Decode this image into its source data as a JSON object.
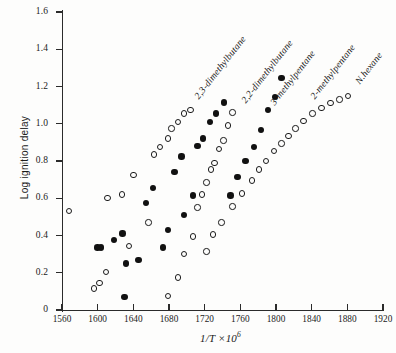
{
  "chart_data": {
    "type": "scatter",
    "title": "",
    "xlabel": "1/T ×10⁶",
    "ylabel": "Log ignition delay",
    "xlim": [
      1560,
      1920
    ],
    "ylim": [
      0.0,
      1.6
    ],
    "xticks": [
      1560,
      1600,
      1640,
      1680,
      1720,
      1760,
      1800,
      1840,
      1880,
      1920
    ],
    "yticks": [
      "0",
      "0.2",
      "0.4",
      "0.6",
      "0.8",
      "1.0",
      "1.2",
      "1.4",
      "1.6"
    ],
    "grid": false,
    "legend_position": "inline-annotations",
    "marker_styles": {
      "open": "open circle",
      "filled": "filled circle"
    },
    "series": [
      {
        "name": "2,3-dimethylbutane",
        "marker": "open",
        "label_angle_deg": -52,
        "label_x": 196,
        "label_y": 92,
        "points": [
          {
            "x": 1568,
            "y": 0.53
          },
          {
            "x": 1596,
            "y": 0.115
          },
          {
            "x": 1602,
            "y": 0.145
          },
          {
            "x": 1609,
            "y": 0.205
          },
          {
            "x": 1611,
            "y": 0.6
          },
          {
            "x": 1627,
            "y": 0.62
          },
          {
            "x": 1635,
            "y": 0.345
          },
          {
            "x": 1640,
            "y": 0.725
          },
          {
            "x": 1657,
            "y": 0.47
          },
          {
            "x": 1663,
            "y": 0.835
          },
          {
            "x": 1670,
            "y": 0.875
          },
          {
            "x": 1679,
            "y": 0.92
          },
          {
            "x": 1683,
            "y": 0.975
          },
          {
            "x": 1690,
            "y": 1.01
          },
          {
            "x": 1697,
            "y": 1.055
          },
          {
            "x": 1704,
            "y": 1.075
          }
        ]
      },
      {
        "name": "2,2-dimethylbutane",
        "marker": "filled",
        "label_angle_deg": -52,
        "label_x": 243,
        "label_y": 96,
        "points": [
          {
            "x": 1600,
            "y": 0.335
          },
          {
            "x": 1604,
            "y": 0.335
          },
          {
            "x": 1618,
            "y": 0.375
          },
          {
            "x": 1628,
            "y": 0.41
          },
          {
            "x": 1632,
            "y": 0.25
          },
          {
            "x": 1646,
            "y": 0.27
          },
          {
            "x": 1630,
            "y": 0.07
          },
          {
            "x": 1654,
            "y": 0.575
          },
          {
            "x": 1662,
            "y": 0.655
          },
          {
            "x": 1673,
            "y": 0.335
          },
          {
            "x": 1679,
            "y": 0.43
          },
          {
            "x": 1686,
            "y": 0.74
          },
          {
            "x": 1694,
            "y": 0.825
          },
          {
            "x": 1697,
            "y": 0.51
          },
          {
            "x": 1707,
            "y": 0.615
          },
          {
            "x": 1712,
            "y": 0.88
          },
          {
            "x": 1718,
            "y": 0.92
          },
          {
            "x": 1726,
            "y": 1.01
          },
          {
            "x": 1733,
            "y": 1.055
          },
          {
            "x": 1742,
            "y": 1.115
          }
        ]
      },
      {
        "name": "3-methylpentane",
        "marker": "open",
        "label_angle_deg": -52,
        "label_x": 272,
        "label_y": 98,
        "points": [
          {
            "x": 1679,
            "y": 0.075
          },
          {
            "x": 1690,
            "y": 0.175
          },
          {
            "x": 1697,
            "y": 0.3
          },
          {
            "x": 1707,
            "y": 0.395
          },
          {
            "x": 1712,
            "y": 0.55
          },
          {
            "x": 1717,
            "y": 0.62
          },
          {
            "x": 1722,
            "y": 0.685
          },
          {
            "x": 1727,
            "y": 0.755
          },
          {
            "x": 1731,
            "y": 0.79
          },
          {
            "x": 1736,
            "y": 0.865
          },
          {
            "x": 1741,
            "y": 0.91
          },
          {
            "x": 1746,
            "y": 0.99
          },
          {
            "x": 1751,
            "y": 1.06
          }
        ]
      },
      {
        "name": "2-methylpentane",
        "marker": "filled",
        "label_angle_deg": -52,
        "label_x": 312,
        "label_y": 92,
        "points": [
          {
            "x": 1749,
            "y": 0.615
          },
          {
            "x": 1757,
            "y": 0.715
          },
          {
            "x": 1766,
            "y": 0.8
          },
          {
            "x": 1775,
            "y": 0.875
          },
          {
            "x": 1783,
            "y": 0.965
          },
          {
            "x": 1791,
            "y": 1.075
          },
          {
            "x": 1799,
            "y": 1.145
          },
          {
            "x": 1806,
            "y": 1.245
          }
        ]
      },
      {
        "name": "N.hexane",
        "marker": "open",
        "label_angle_deg": -52,
        "label_x": 357,
        "label_y": 77,
        "points": [
          {
            "x": 1722,
            "y": 0.315
          },
          {
            "x": 1729,
            "y": 0.405
          },
          {
            "x": 1739,
            "y": 0.47
          },
          {
            "x": 1751,
            "y": 0.555
          },
          {
            "x": 1762,
            "y": 0.625
          },
          {
            "x": 1773,
            "y": 0.695
          },
          {
            "x": 1781,
            "y": 0.755
          },
          {
            "x": 1789,
            "y": 0.8
          },
          {
            "x": 1798,
            "y": 0.855
          },
          {
            "x": 1806,
            "y": 0.895
          },
          {
            "x": 1814,
            "y": 0.935
          },
          {
            "x": 1822,
            "y": 0.975
          },
          {
            "x": 1831,
            "y": 1.015
          },
          {
            "x": 1841,
            "y": 1.055
          },
          {
            "x": 1851,
            "y": 1.085
          },
          {
            "x": 1861,
            "y": 1.11
          },
          {
            "x": 1871,
            "y": 1.13
          },
          {
            "x": 1881,
            "y": 1.15
          }
        ]
      }
    ]
  }
}
